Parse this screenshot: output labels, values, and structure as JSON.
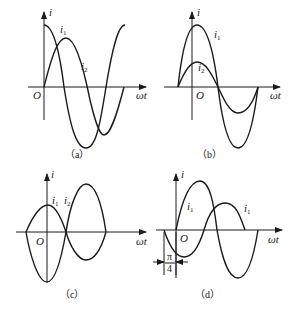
{
  "panels": [
    {
      "id": "a",
      "caption": "（a）",
      "y_label": "i",
      "x_label": "ωt",
      "origin_label": "O",
      "curve_labels": [
        "i1",
        "i2"
      ]
    },
    {
      "id": "b",
      "caption": "（b）",
      "y_label": "i",
      "x_label": "ωt",
      "origin_label": "O",
      "curve_labels": [
        "i1",
        "i2"
      ]
    },
    {
      "id": "c",
      "caption": "（c）",
      "y_label": "i",
      "x_label": "ωt",
      "origin_label": "O",
      "curve_labels": [
        "i1",
        "i2"
      ]
    },
    {
      "id": "d",
      "caption": "（d）",
      "y_label": "i",
      "x_label": "ωt",
      "origin_label": "O",
      "curve_labels": [
        "i1",
        "i1"
      ],
      "phase_annotation": {
        "numerator": "π",
        "denominator": "4"
      }
    }
  ],
  "text": {
    "i": "i",
    "one": "1",
    "two": "2",
    "wt": "ωt",
    "O": "O",
    "cap_a": "（a）",
    "cap_b": "（b）",
    "cap_c": "（c）",
    "cap_d": "（d）",
    "pi": "π",
    "four": "4"
  }
}
